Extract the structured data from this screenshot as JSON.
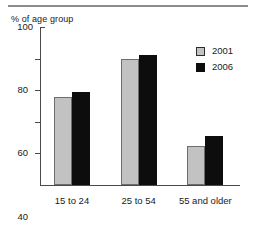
{
  "figure": {
    "y_axis_caption": "% of age group"
  },
  "legend": {
    "position": "top-right",
    "entries": [
      {
        "label": "2001",
        "swatch": "gray-square-swatch",
        "color": "#c2c2c2"
      },
      {
        "label": "2006",
        "swatch": "black-square-swatch",
        "color": "#0d0d0d"
      }
    ]
  },
  "chart_data": {
    "type": "bar",
    "title": "",
    "subtitle": "",
    "xlabel": "",
    "ylabel": "% of age group",
    "categories": [
      "15 to 24",
      "25 to 54",
      "55 and older"
    ],
    "series": [
      {
        "name": "2001",
        "color": "#c2c2c2",
        "values": [
          56,
          80,
          25
        ]
      },
      {
        "name": "2006",
        "color": "#0d0d0d",
        "values": [
          59,
          82,
          31
        ]
      }
    ],
    "ylim": [
      0,
      100
    ],
    "yticks": [
      0,
      20,
      40,
      60,
      80,
      100
    ],
    "ytick_labels": [
      "0",
      "20",
      "40",
      "60",
      "80",
      "100"
    ],
    "grid": false,
    "legend_position": "top-right"
  }
}
